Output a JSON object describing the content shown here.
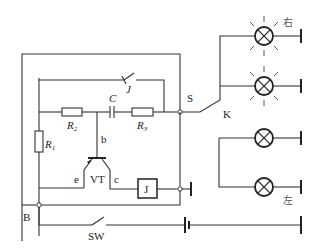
{
  "diagram": {
    "labels": {
      "R1": "R",
      "R1_sub": "1",
      "R2": "R",
      "R2_sub": "2",
      "R3": "R",
      "R3_sub": "3",
      "C": "C",
      "J_switch": "J",
      "J_relay": "J",
      "b": "b",
      "e": "e",
      "c": "c",
      "VT": "VT",
      "S": "S",
      "K": "K",
      "B": "B",
      "SW": "SW",
      "right": "右",
      "left": "左"
    },
    "components": [
      {
        "id": "R1",
        "type": "resistor"
      },
      {
        "id": "R2",
        "type": "resistor"
      },
      {
        "id": "R3",
        "type": "resistor"
      },
      {
        "id": "C",
        "type": "capacitor"
      },
      {
        "id": "VT",
        "type": "transistor"
      },
      {
        "id": "J",
        "type": "relay-coil"
      },
      {
        "id": "J-contact",
        "type": "switch"
      },
      {
        "id": "SW",
        "type": "switch"
      },
      {
        "id": "K",
        "type": "selector-switch"
      },
      {
        "id": "battery",
        "type": "battery"
      },
      {
        "id": "lamp-right-1",
        "type": "lamp",
        "state": "lit"
      },
      {
        "id": "lamp-right-2",
        "type": "lamp",
        "state": "lit"
      },
      {
        "id": "lamp-left-1",
        "type": "lamp",
        "state": "off"
      },
      {
        "id": "lamp-left-2",
        "type": "lamp",
        "state": "off"
      }
    ]
  }
}
